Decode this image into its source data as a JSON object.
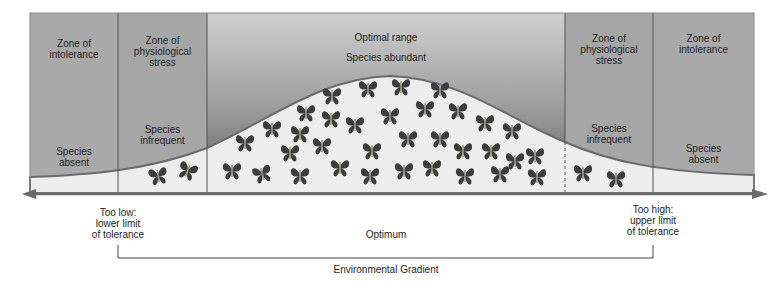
{
  "zones": [
    {
      "id": "intolerance-low",
      "title": "Zone of intolerance",
      "status": "Species absent"
    },
    {
      "id": "stress-low",
      "title": "Zone of physiological stress",
      "status": "Species infrequent"
    },
    {
      "id": "optimal",
      "title": "Optimal range",
      "status": "Species abundant"
    },
    {
      "id": "stress-high",
      "title": "Zone of physiological stress",
      "status": "Species infrequent"
    },
    {
      "id": "intolerance-high",
      "title": "Zone of intolerance",
      "status": "Species absent"
    }
  ],
  "labels": {
    "z1_title_a": "Zone of",
    "z1_title_b": "intolerance",
    "z1_status_a": "Species",
    "z1_status_b": "absent",
    "z2_title_a": "Zone of",
    "z2_title_b": "physiological",
    "z2_title_c": "stress",
    "z2_status_a": "Species",
    "z2_status_b": "infrequent",
    "z3_title": "Optimal range",
    "z3_status": "Species abundant",
    "z4_title_a": "Zone of",
    "z4_title_b": "physiological",
    "z4_title_c": "stress",
    "z4_status_a": "Species",
    "z4_status_b": "infrequent",
    "z5_title_a": "Zone of",
    "z5_title_b": "intolerance",
    "z5_status_a": "Species",
    "z5_status_b": "absent",
    "low_a": "Too low:",
    "low_b": "lower limit",
    "low_c": "of tolerance",
    "optimum": "Optimum",
    "high_a": "Too high:",
    "high_b": "upper limit",
    "high_c": "of tolerance",
    "gradient": "Environmental Gradient"
  },
  "colors": {
    "zone_fill": "#a9a9a9",
    "optimal_top": "#c8c8c8",
    "optimal_bottom": "#6e6e6e",
    "curve_fill": "#ececec",
    "curve_stroke": "#6a6a6a",
    "butterfly": "#3c3c3c",
    "axis": "#6a6a6a"
  }
}
